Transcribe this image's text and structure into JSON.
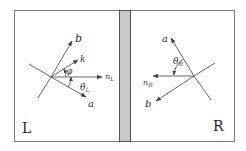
{
  "diagram": {
    "colors": {
      "line": "#555555",
      "frame": "#666666",
      "barFill": "#c8c8c8",
      "barStroke": "#555555",
      "background": "#ffffff"
    },
    "left_panel": {
      "label": "L",
      "vectors": {
        "b": "b",
        "k": "k",
        "n": "n",
        "n_sub": "L",
        "a": "a"
      },
      "angles": {
        "phi": "φ",
        "theta": "θ",
        "theta_sub": "L"
      }
    },
    "right_panel": {
      "label": "R",
      "vectors": {
        "a": "a",
        "b": "b",
        "n": "n",
        "n_sub": "R"
      },
      "angles": {
        "theta": "θ",
        "theta_sub": "R"
      }
    },
    "divider": "gray-barrier"
  }
}
